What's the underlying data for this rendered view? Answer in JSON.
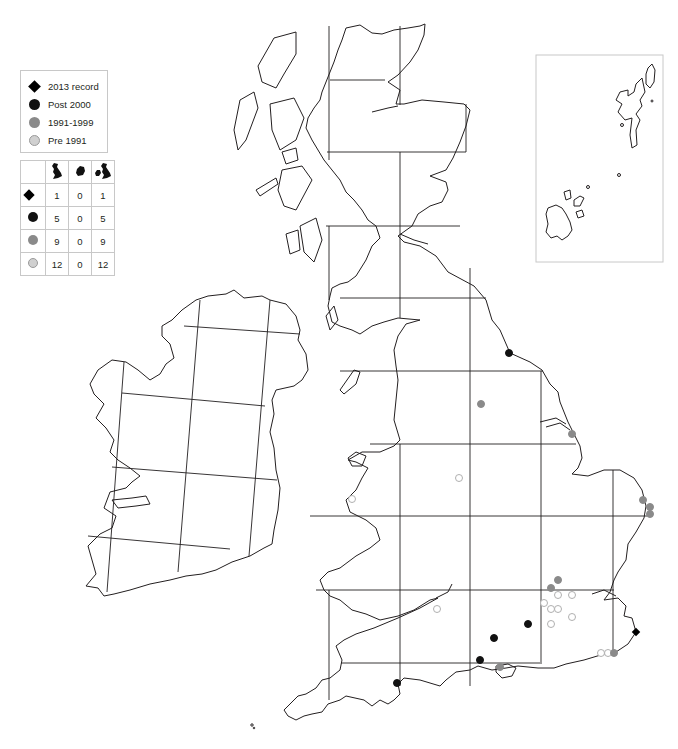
{
  "map": {
    "type": "species distribution map",
    "region": "Britain and Ireland",
    "inset_label": "Orkney and Shetland inset"
  },
  "legend": {
    "items": [
      {
        "symbol": "diamond",
        "label": "2013 record",
        "color": "#000000"
      },
      {
        "symbol": "dot-black",
        "label": "Post 2000",
        "color": "#111111"
      },
      {
        "symbol": "dot-grey",
        "label": "1991-1999",
        "color": "#8a8a8a"
      },
      {
        "symbol": "dot-light",
        "label": "Pre 1991",
        "color": "#d0d0d0"
      }
    ]
  },
  "count_table": {
    "header_icons": [
      "great-britain-icon",
      "ireland-icon",
      "britain-and-ireland-icon"
    ],
    "rows": [
      {
        "symbol": "diamond",
        "gb": "1",
        "ireland": "0",
        "total": "1"
      },
      {
        "symbol": "dot-black",
        "gb": "5",
        "ireland": "0",
        "total": "5"
      },
      {
        "symbol": "dot-grey",
        "gb": "9",
        "ireland": "0",
        "total": "9"
      },
      {
        "symbol": "dot-light",
        "gb": "12",
        "ireland": "0",
        "total": "12"
      }
    ]
  },
  "records": {
    "record_2013": [
      [
        636,
        632
      ]
    ],
    "post_2000": [
      [
        509,
        353
      ],
      [
        528,
        624
      ],
      [
        494,
        638
      ],
      [
        480,
        660
      ],
      [
        397,
        683
      ]
    ],
    "y1991_1999": [
      [
        481,
        404
      ],
      [
        572,
        434
      ],
      [
        643,
        500
      ],
      [
        650,
        507
      ],
      [
        650,
        514
      ],
      [
        558,
        580
      ],
      [
        551,
        588
      ],
      [
        614,
        653
      ],
      [
        500,
        667
      ]
    ],
    "pre_1991": [
      [
        459,
        478
      ],
      [
        352,
        499
      ],
      [
        437,
        609
      ],
      [
        544,
        603
      ],
      [
        558,
        595
      ],
      [
        572,
        595
      ],
      [
        551,
        609
      ],
      [
        558,
        609
      ],
      [
        572,
        617
      ],
      [
        551,
        624
      ],
      [
        601,
        653
      ],
      [
        608,
        653
      ]
    ]
  },
  "colors": {
    "coast": "#231f20",
    "grid": "#231f20",
    "frame": "#c8c8c8",
    "post_2000": "#111111",
    "y1991_1999": "#8a8a8a",
    "pre_1991_fill": "#ffffff",
    "pre_1991_stroke": "#b0b0b0"
  }
}
